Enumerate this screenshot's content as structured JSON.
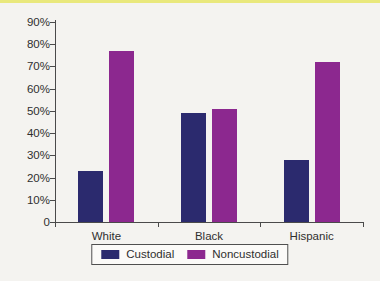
{
  "page": {
    "background_color": "#f4f3f0",
    "top_accent_color": "#e9e87c"
  },
  "chart_data": {
    "type": "bar",
    "title": "",
    "xlabel": "",
    "ylabel": "",
    "categories": [
      "White",
      "Black",
      "Hispanic"
    ],
    "series": [
      {
        "name": "Custodial",
        "color": "#2b2a6e",
        "values": [
          23,
          49,
          28
        ]
      },
      {
        "name": "Noncustodial",
        "color": "#8c288f",
        "values": [
          77,
          51,
          72
        ]
      }
    ],
    "ylim": [
      0,
      90
    ],
    "ytick_step": 10,
    "ytick_labels": [
      "0",
      "10%",
      "20%",
      "30%",
      "40%",
      "50%",
      "60%",
      "70%",
      "80%",
      "90%"
    ],
    "grid": false,
    "legend_position": "bottom",
    "axis_color": "#4a4a4a",
    "text_color": "#2f2f2f"
  }
}
